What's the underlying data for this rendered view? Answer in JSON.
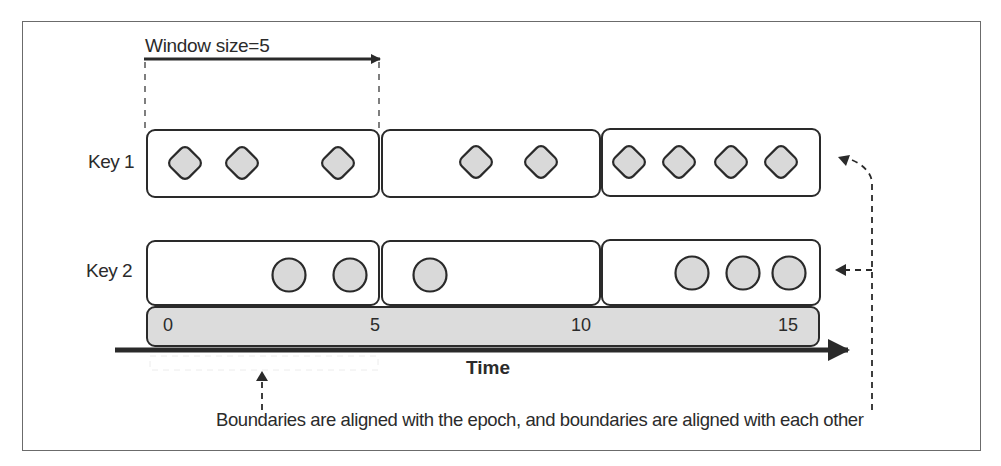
{
  "figure": {
    "window_label": "Window size=5",
    "caption": "Boundaries are aligned with the epoch, and boundaries are aligned with each other",
    "time_axis_label": "Time",
    "ticks": [
      {
        "value": "0",
        "x": 170
      },
      {
        "value": "5",
        "x": 372
      },
      {
        "value": "10",
        "x": 576
      },
      {
        "value": "15",
        "x": 784
      }
    ],
    "rows": [
      {
        "label": "Key 1",
        "shape": "diamond",
        "windows": [
          {
            "range": "0-5",
            "events": 3
          },
          {
            "range": "5-10",
            "events": 2
          },
          {
            "range": "10-15",
            "events": 4
          }
        ]
      },
      {
        "label": "Key 2",
        "shape": "circle",
        "windows": [
          {
            "range": "0-5",
            "events": 2
          },
          {
            "range": "5-10",
            "events": 1
          },
          {
            "range": "10-15",
            "events": 3
          }
        ]
      }
    ],
    "colors": {
      "stroke": "#2a2a2a",
      "event_fill": "#d9d9d9",
      "timeline_fill": "#dcdcdc",
      "frame": "#6b6b6b"
    }
  }
}
